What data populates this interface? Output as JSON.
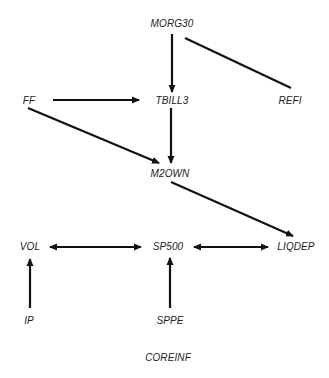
{
  "diagram": {
    "type": "directed-graph",
    "nodes": [
      {
        "id": "MORG30",
        "label": "MORG30",
        "x": 172,
        "y": 24
      },
      {
        "id": "FF",
        "label": "FF",
        "x": 29,
        "y": 101
      },
      {
        "id": "TBILL3",
        "label": "TBILL3",
        "x": 172,
        "y": 101
      },
      {
        "id": "REFI",
        "label": "REFI",
        "x": 290,
        "y": 101
      },
      {
        "id": "M2OWN",
        "label": "M2OWN",
        "x": 170,
        "y": 174
      },
      {
        "id": "VOL",
        "label": "VOL",
        "x": 30,
        "y": 247
      },
      {
        "id": "SP500",
        "label": "SP500",
        "x": 168,
        "y": 247
      },
      {
        "id": "LIQDEP",
        "label": "LIQDEP",
        "x": 296,
        "y": 247
      },
      {
        "id": "IP",
        "label": "IP",
        "x": 29,
        "y": 321
      },
      {
        "id": "SPPE",
        "label": "SPPE",
        "x": 170,
        "y": 321
      },
      {
        "id": "COREINF",
        "label": "COREINF",
        "x": 168,
        "y": 358
      }
    ],
    "edges": [
      {
        "from": "MORG30",
        "to": "TBILL3",
        "type": "directed"
      },
      {
        "from": "MORG30",
        "to": "REFI",
        "type": "undirected"
      },
      {
        "from": "FF",
        "to": "TBILL3",
        "type": "directed"
      },
      {
        "from": "FF",
        "to": "M2OWN",
        "type": "directed"
      },
      {
        "from": "TBILL3",
        "to": "M2OWN",
        "type": "directed"
      },
      {
        "from": "M2OWN",
        "to": "LIQDEP",
        "type": "directed"
      },
      {
        "from": "VOL",
        "to": "SP500",
        "type": "bidirected"
      },
      {
        "from": "SP500",
        "to": "LIQDEP",
        "type": "bidirected"
      },
      {
        "from": "IP",
        "to": "VOL",
        "type": "directed"
      },
      {
        "from": "SPPE",
        "to": "SP500",
        "type": "directed"
      }
    ]
  },
  "labels": {
    "morg30": "MORG30",
    "ff": "FF",
    "tbill3": "TBILL3",
    "refi": "REFI",
    "m2own": "M2OWN",
    "vol": "VOL",
    "sp500": "SP500",
    "liqdep": "LIQDEP",
    "ip": "IP",
    "sppe": "SPPE",
    "coreinf": "COREINF"
  },
  "colors": {
    "edge": "#111111",
    "text": "#222222",
    "background": "#ffffff"
  }
}
